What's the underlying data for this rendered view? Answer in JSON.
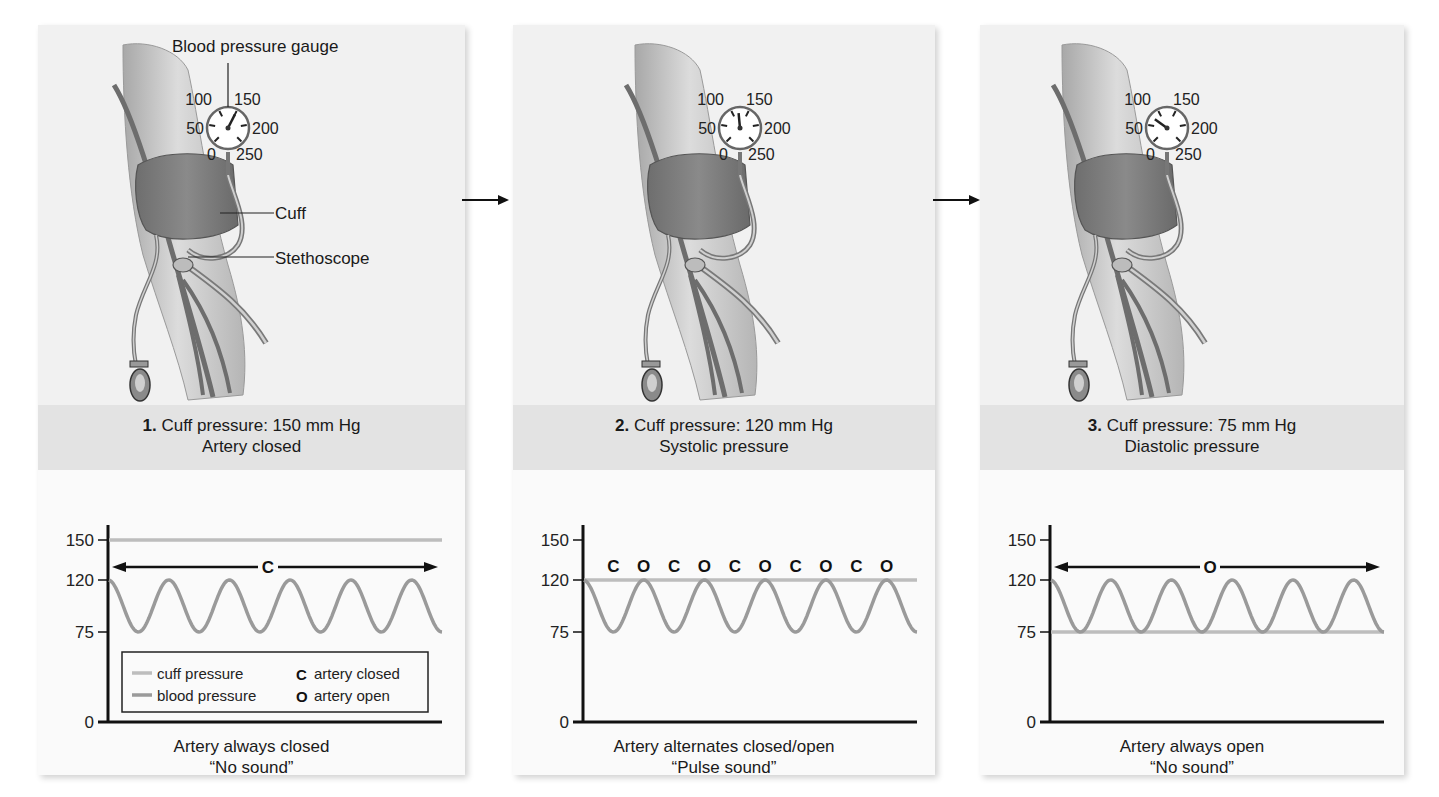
{
  "annotations": {
    "gauge_label": "Blood pressure gauge",
    "cuff_label": "Cuff",
    "stethoscope_label": "Stethoscope",
    "gauge_ticks": [
      "0",
      "50",
      "100",
      "150",
      "200",
      "250"
    ]
  },
  "colors": {
    "cuff_line": "#bdbdbd",
    "blood_line": "#9a9a9a",
    "axis": "#111111",
    "panel_bg": "#f1f1f1",
    "header_bg": "#e3e3e3",
    "chart_bg": "#fafafa"
  },
  "legend": {
    "cuff": "cuff pressure",
    "blood": "blood pressure",
    "closed_symbol": "C",
    "closed": "artery closed",
    "open_symbol": "O",
    "open": "artery open"
  },
  "panels": [
    {
      "step": "1.",
      "heading": "Cuff pressure: 150 mm Hg",
      "subheading": "Artery closed",
      "caption1": "Artery always closed",
      "caption2": "“No sound”",
      "gauge_needle_value": 150,
      "arrow_label": "C"
    },
    {
      "step": "2.",
      "heading": "Cuff pressure: 120 mm Hg",
      "subheading": "Systolic pressure",
      "caption1": "Artery alternates closed/open",
      "caption2": "“Pulse sound”",
      "gauge_needle_value": 120,
      "markers": [
        "C",
        "O",
        "C",
        "O",
        "C",
        "O",
        "C",
        "O",
        "C",
        "O"
      ]
    },
    {
      "step": "3.",
      "heading": "Cuff pressure: 75 mm Hg",
      "subheading": "Diastolic pressure",
      "caption1": "Artery always open",
      "caption2": "“No sound”",
      "gauge_needle_value": 75,
      "arrow_label": "O"
    }
  ],
  "chart_data": [
    {
      "type": "line",
      "title": "1. Cuff pressure: 150 mm Hg — Artery closed",
      "xlabel": "Artery always closed — “No sound”",
      "ylabel": "mm Hg",
      "yticks": [
        0,
        75,
        120,
        150
      ],
      "ylim": [
        0,
        150
      ],
      "series": [
        {
          "name": "cuff pressure",
          "constant": 150
        },
        {
          "name": "blood pressure",
          "waveform": "sine",
          "min": 75,
          "max": 120,
          "cycles": 5.5
        }
      ],
      "annotation": "C (artery closed) throughout",
      "legend_position": "inside-lower"
    },
    {
      "type": "line",
      "title": "2. Cuff pressure: 120 mm Hg — Systolic pressure",
      "xlabel": "Artery alternates closed/open — “Pulse sound”",
      "ylabel": "mm Hg",
      "yticks": [
        0,
        75,
        120,
        150
      ],
      "ylim": [
        0,
        150
      ],
      "series": [
        {
          "name": "cuff pressure",
          "constant": 120
        },
        {
          "name": "blood pressure",
          "waveform": "sine",
          "min": 75,
          "max": 120,
          "cycles": 5.5
        }
      ],
      "annotation": "C O C O C O C O C O"
    },
    {
      "type": "line",
      "title": "3. Cuff pressure: 75 mm Hg — Diastolic pressure",
      "xlabel": "Artery always open — “No sound”",
      "ylabel": "mm Hg",
      "yticks": [
        0,
        75,
        120,
        150
      ],
      "ylim": [
        0,
        150
      ],
      "series": [
        {
          "name": "cuff pressure",
          "constant": 75
        },
        {
          "name": "blood pressure",
          "waveform": "sine",
          "min": 75,
          "max": 120,
          "cycles": 5.5
        }
      ],
      "annotation": "O (artery open) throughout"
    }
  ]
}
